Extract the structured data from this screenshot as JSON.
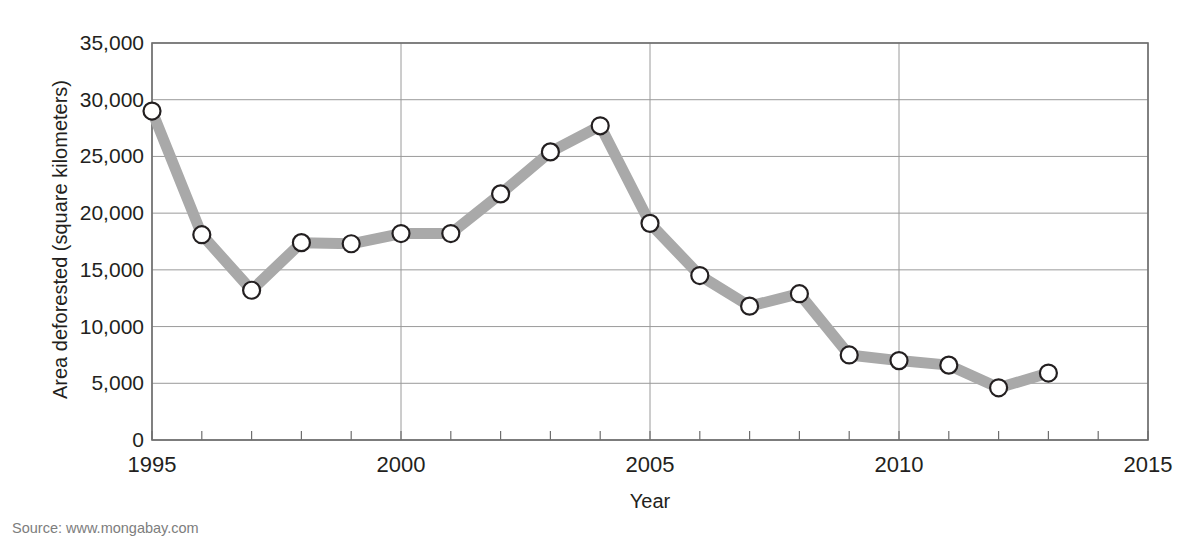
{
  "chart_data": {
    "type": "line",
    "title": "Deforestation Rates in Brazil",
    "xlabel": "Year",
    "ylabel": "Area deforested (square kilometers)",
    "xlim": [
      1995,
      2015
    ],
    "ylim": [
      0,
      35000
    ],
    "grid": true,
    "legend": false,
    "source": "Source: www.mongabay.com",
    "x_tick_labels": [
      "1995",
      "2000",
      "2005",
      "2010",
      "2015"
    ],
    "x_tick_values": [
      1995,
      2000,
      2005,
      2010,
      2015
    ],
    "x_minor_tick_step": 1,
    "y_tick_labels": [
      "0",
      "5,000",
      "10,000",
      "15,000",
      "20,000",
      "25,000",
      "30,000",
      "35,000"
    ],
    "y_tick_values": [
      0,
      5000,
      10000,
      15000,
      20000,
      25000,
      30000,
      35000
    ],
    "x": [
      1995,
      1996,
      1997,
      1998,
      1999,
      2000,
      2001,
      2002,
      2003,
      2004,
      2005,
      2006,
      2007,
      2008,
      2009,
      2010,
      2011,
      2012,
      2013
    ],
    "values": [
      29000,
      18100,
      13200,
      17400,
      17300,
      18200,
      18200,
      21700,
      25400,
      27700,
      19100,
      14500,
      11800,
      12900,
      7500,
      7000,
      6600,
      4600,
      5900
    ],
    "series": [
      {
        "name": "Area deforested",
        "values": [
          29000,
          18100,
          13200,
          17400,
          17300,
          18200,
          18200,
          21700,
          25400,
          27700,
          19100,
          14500,
          11800,
          12900,
          7500,
          7000,
          6600,
          4600,
          5900
        ]
      }
    ],
    "colors": {
      "line": "#a9a9a9",
      "marker_fill": "#ffffff",
      "marker_stroke": "#231f20",
      "grid": "#9a9a9a",
      "axis": "#6e6e6e",
      "text": "#231f20",
      "source_text": "#7d7d7d"
    }
  }
}
